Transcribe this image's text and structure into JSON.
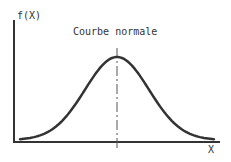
{
  "diagram": {
    "title": "Courbe normale",
    "y_axis_label": "f(X)",
    "x_axis_label": "X",
    "colors": {
      "stroke": "#333333",
      "background": "#ffffff"
    }
  },
  "chart_data": {
    "type": "line",
    "title": "Courbe normale",
    "xlabel": "X",
    "ylabel": "f(X)",
    "series": [
      {
        "name": "normal-density",
        "x": [
          -3,
          -2.5,
          -2,
          -1.5,
          -1,
          -0.5,
          0,
          0.5,
          1,
          1.5,
          2,
          2.5,
          3
        ],
        "values": [
          0.004,
          0.018,
          0.054,
          0.13,
          0.242,
          0.352,
          0.399,
          0.352,
          0.242,
          0.13,
          0.054,
          0.018,
          0.004
        ]
      }
    ],
    "annotations": [
      "dashed vertical line at mean (x=0)"
    ],
    "grid": false,
    "legend": false
  }
}
